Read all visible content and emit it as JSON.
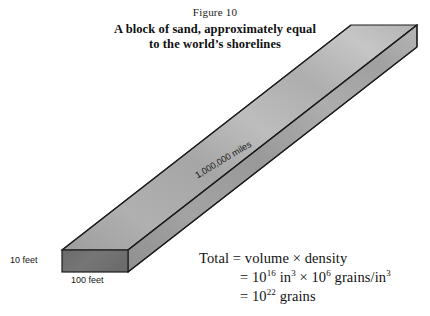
{
  "figure": {
    "caption_number": "Figure 10",
    "title_line1": "A block of sand, approximately equal",
    "title_line2": "to the world’s shorelines"
  },
  "dimensions": {
    "height": "10 feet",
    "width": "100 feet",
    "length": "1,000,000 miles"
  },
  "equation": {
    "line1_label": "Total",
    "line1_eq": "=",
    "line1_expr": "volume × density",
    "line2_eq": "=",
    "line2_base1": "10",
    "line2_exp1": "16",
    "line2_unit1": "in",
    "line2_unit1_exp": "3",
    "line2_times": "×",
    "line2_base2": "10",
    "line2_exp2": "6",
    "line2_unit2": "grains/in",
    "line2_unit2_exp": "3",
    "line3_eq": "=",
    "line3_base": "10",
    "line3_exp": "22",
    "line3_unit": "grains"
  },
  "colors": {
    "top_face": "#b4b4b4",
    "front_face": "#a0a0a0",
    "end_cap": "#6e6e6e",
    "outline": "#1c1c1c",
    "background": "#ffffff"
  }
}
